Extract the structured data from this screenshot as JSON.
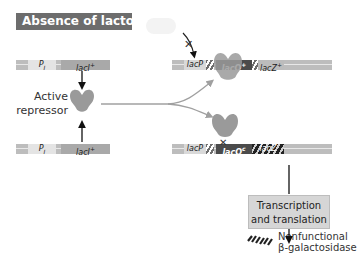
{
  "title": "Absence of lactose",
  "left_column": {
    "top_gene": {
      "promoter": "P",
      "promoter_sub": "I",
      "gene": "lacI",
      "gene_sup": "+"
    },
    "bottom_gene": {
      "promoter": "P",
      "promoter_sub": "I",
      "gene": "lacI",
      "gene_sup": "+"
    },
    "repressor_label_line1": "Active",
    "repressor_label_line2": "repressor"
  },
  "top_operon": {
    "promoter": "lacP",
    "operator": "lacO",
    "operator_sup": "+",
    "gene": "lacZ",
    "gene_sup": "+",
    "blocked_marker": "✕",
    "state": "repressor bound, transcription blocked"
  },
  "bottom_operon": {
    "promoter": "lacP",
    "operator": "lacO",
    "operator_sup": "c",
    "gene": "lacZ",
    "blocked_marker": "✕",
    "state": "repressor cannot bind operator-constitutive"
  },
  "process_box": {
    "line1": "Transcription",
    "line2": "and translation"
  },
  "product": {
    "line1": "Nonfunctional",
    "line2": "β-galactosidase"
  },
  "colors": {
    "title_bg": "#6d6d6d",
    "repressor": "#9a9a9a",
    "operator_bg": "#4b4b4b",
    "arrow": "#111111",
    "curve_arrow": "#9a9a9a"
  }
}
